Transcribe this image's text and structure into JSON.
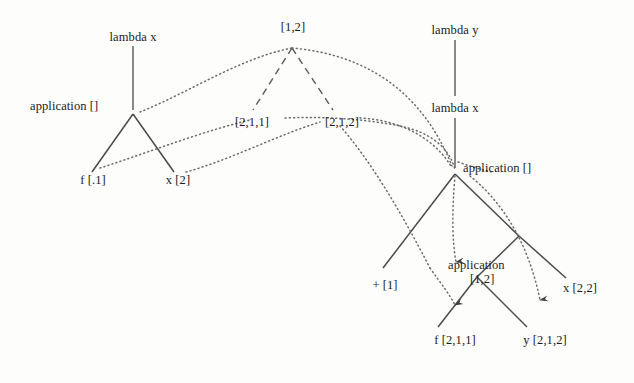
{
  "diagram": {
    "background_color": "#fdfdfc",
    "line_color": "#4a4a4a",
    "text_color": "#1b1b1b",
    "labels": {
      "lambda_x_left": "lambda x",
      "application_left": "application  []",
      "f_left": "f [.1]",
      "x_left": "x [2]",
      "top_path": "[1,2]",
      "path_211": "[2,1,1]",
      "path_212": "[2,1,2]",
      "lambda_y_right": "lambda y",
      "lambda_x_right": "lambda x",
      "application_right": "application []",
      "plus_one": "+ [1]",
      "application_inner_line1": "application",
      "application_inner_line2": "[1,2]",
      "x_22": "x [2,2]",
      "f_211": "f [2,1,1]",
      "y_212": "y [2,1,2]"
    }
  }
}
